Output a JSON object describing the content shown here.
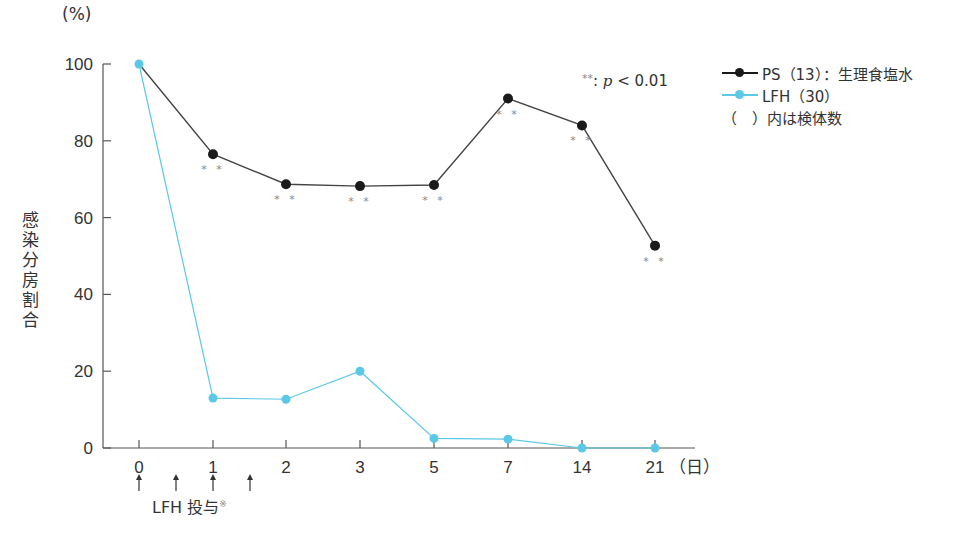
{
  "chart_data": {
    "type": "line",
    "title": "",
    "xlabel": "(日)",
    "ylabel": "感染分房割合",
    "yunit": "(%)",
    "ylim": [
      0,
      100
    ],
    "yticks": [
      0,
      20,
      40,
      60,
      80,
      100
    ],
    "categories": [
      "0",
      "1",
      "2",
      "3",
      "5",
      "7",
      "14",
      "21"
    ],
    "series": [
      {
        "name": "PS（13）：生理食塩水",
        "color": "#1a1a1a",
        "values": [
          100,
          76.5,
          68.7,
          68.2,
          68.5,
          91,
          84,
          52.7
        ],
        "significant": [
          false,
          true,
          true,
          true,
          true,
          true,
          true,
          true
        ]
      },
      {
        "name": "LFH（30）",
        "color": "#5bc8e6",
        "values": [
          100,
          13,
          12.7,
          20,
          2.5,
          2.3,
          0,
          0
        ]
      }
    ],
    "annotations": [
      "**: p < 0.01",
      "（ ）内は検体数",
      "LFH 投与※"
    ],
    "admin_arrows_at": [
      0,
      0.5,
      1,
      1.5
    ],
    "grid": false,
    "legend_position": "top-right"
  },
  "labels": {
    "unit": "(%)",
    "ylabel": "感染分房割合",
    "pnote_stars": "**",
    "pnote_sep": ": ",
    "pnote_p": "p",
    "pnote_rest": " < 0.01",
    "legend_ps": "PS（13）：生理食塩水",
    "legend_lfh": "LFH（30）",
    "legend_note": "（　）内は検体数",
    "admin_label": "LFH 投与",
    "admin_mark": "※",
    "xunit": "（日）"
  }
}
